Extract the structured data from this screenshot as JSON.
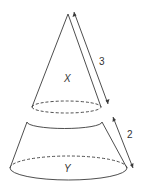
{
  "figure": {
    "type": "geometry-diagram",
    "solids": [
      {
        "name": "cone",
        "label": "X"
      },
      {
        "name": "frustum",
        "label": "Y"
      }
    ],
    "dimensions": [
      {
        "name": "cone-slant-height",
        "value": "3"
      },
      {
        "name": "frustum-slant-height",
        "value": "2"
      }
    ],
    "colors": {
      "line": "#3a3a3a",
      "background": "#ffffff"
    }
  }
}
